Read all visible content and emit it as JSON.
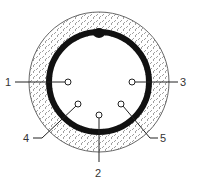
{
  "diagram": {
    "colors": {
      "ring": "#111111",
      "outline": "#555555",
      "hatch": "#777777",
      "leader": "#222222",
      "label": "#333333"
    },
    "pins": [
      {
        "id": "1",
        "label": "1"
      },
      {
        "id": "2",
        "label": "2"
      },
      {
        "id": "3",
        "label": "3"
      },
      {
        "id": "4",
        "label": "4"
      },
      {
        "id": "5",
        "label": "5"
      }
    ]
  }
}
